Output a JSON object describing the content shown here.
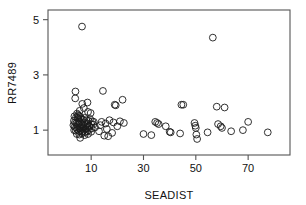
{
  "chart_data": {
    "type": "scatter",
    "title": "",
    "xlabel": "SEADIST",
    "ylabel": "RR7489",
    "xlim": [
      -6.5,
      86
    ],
    "ylim": [
      0.1,
      5.35
    ],
    "grid": false,
    "legend": null,
    "xticks": [
      10,
      30,
      50,
      70
    ],
    "xticklabels": [
      "10",
      "30",
      "50",
      "70"
    ],
    "yticks": [
      1,
      3,
      5
    ],
    "yticklabels": [
      "1",
      "3",
      "5"
    ],
    "marker": "open-circle",
    "marker_color": "#1b1b1b",
    "n_points": 108,
    "points": [
      {
        "x": 6.5,
        "y": 4.75
      },
      {
        "x": 56.5,
        "y": 4.35
      },
      {
        "x": 4.0,
        "y": 2.4
      },
      {
        "x": 14.5,
        "y": 2.42
      },
      {
        "x": 3.9,
        "y": 2.15
      },
      {
        "x": 8.6,
        "y": 2.0
      },
      {
        "x": 22.0,
        "y": 2.1
      },
      {
        "x": 19.0,
        "y": 1.92
      },
      {
        "x": 19.4,
        "y": 1.9
      },
      {
        "x": 6.6,
        "y": 1.95
      },
      {
        "x": 7.2,
        "y": 1.8
      },
      {
        "x": 44.5,
        "y": 1.92
      },
      {
        "x": 45.2,
        "y": 1.92
      },
      {
        "x": 58.0,
        "y": 1.85
      },
      {
        "x": 61.0,
        "y": 1.82
      },
      {
        "x": 5.6,
        "y": 1.7
      },
      {
        "x": 8.8,
        "y": 1.66
      },
      {
        "x": 9.8,
        "y": 1.62
      },
      {
        "x": 4.6,
        "y": 1.6
      },
      {
        "x": 5.0,
        "y": 1.55
      },
      {
        "x": 5.4,
        "y": 1.52
      },
      {
        "x": 3.6,
        "y": 1.5
      },
      {
        "x": 4.2,
        "y": 1.46
      },
      {
        "x": 4.8,
        "y": 1.44
      },
      {
        "x": 5.2,
        "y": 1.42
      },
      {
        "x": 5.9,
        "y": 1.48
      },
      {
        "x": 6.3,
        "y": 1.4
      },
      {
        "x": 6.9,
        "y": 1.38
      },
      {
        "x": 7.5,
        "y": 1.44
      },
      {
        "x": 8.2,
        "y": 1.36
      },
      {
        "x": 9.0,
        "y": 1.34
      },
      {
        "x": 9.6,
        "y": 1.4
      },
      {
        "x": 10.4,
        "y": 1.32
      },
      {
        "x": 11.0,
        "y": 1.3
      },
      {
        "x": 3.4,
        "y": 1.34
      },
      {
        "x": 3.8,
        "y": 1.28
      },
      {
        "x": 4.4,
        "y": 1.26
      },
      {
        "x": 5.0,
        "y": 1.24
      },
      {
        "x": 5.6,
        "y": 1.3
      },
      {
        "x": 6.2,
        "y": 1.22
      },
      {
        "x": 6.8,
        "y": 1.2
      },
      {
        "x": 7.4,
        "y": 1.26
      },
      {
        "x": 8.0,
        "y": 1.18
      },
      {
        "x": 8.6,
        "y": 1.24
      },
      {
        "x": 9.2,
        "y": 1.16
      },
      {
        "x": 10.0,
        "y": 1.22
      },
      {
        "x": 10.8,
        "y": 1.2
      },
      {
        "x": 3.2,
        "y": 1.18
      },
      {
        "x": 3.7,
        "y": 1.12
      },
      {
        "x": 4.3,
        "y": 1.1
      },
      {
        "x": 4.9,
        "y": 1.14
      },
      {
        "x": 5.5,
        "y": 1.08
      },
      {
        "x": 6.1,
        "y": 1.12
      },
      {
        "x": 6.7,
        "y": 1.06
      },
      {
        "x": 7.3,
        "y": 1.1
      },
      {
        "x": 7.9,
        "y": 1.04
      },
      {
        "x": 8.5,
        "y": 1.08
      },
      {
        "x": 9.4,
        "y": 1.12
      },
      {
        "x": 10.2,
        "y": 1.06
      },
      {
        "x": 11.5,
        "y": 1.1
      },
      {
        "x": 3.5,
        "y": 1.0
      },
      {
        "x": 4.1,
        "y": 0.98
      },
      {
        "x": 4.7,
        "y": 1.02
      },
      {
        "x": 5.3,
        "y": 0.96
      },
      {
        "x": 5.9,
        "y": 1.0
      },
      {
        "x": 6.5,
        "y": 0.94
      },
      {
        "x": 7.1,
        "y": 0.98
      },
      {
        "x": 7.7,
        "y": 0.92
      },
      {
        "x": 8.4,
        "y": 0.96
      },
      {
        "x": 9.1,
        "y": 1.0
      },
      {
        "x": 10.0,
        "y": 0.94
      },
      {
        "x": 4.5,
        "y": 0.86
      },
      {
        "x": 5.5,
        "y": 0.84
      },
      {
        "x": 6.5,
        "y": 0.88
      },
      {
        "x": 7.5,
        "y": 0.82
      },
      {
        "x": 8.8,
        "y": 0.86
      },
      {
        "x": 5.8,
        "y": 0.72
      },
      {
        "x": 14.0,
        "y": 1.3
      },
      {
        "x": 15.5,
        "y": 1.24
      },
      {
        "x": 13.5,
        "y": 1.18
      },
      {
        "x": 17.0,
        "y": 1.36
      },
      {
        "x": 18.5,
        "y": 1.28
      },
      {
        "x": 21.0,
        "y": 1.32
      },
      {
        "x": 22.5,
        "y": 1.26
      },
      {
        "x": 16.0,
        "y": 1.04
      },
      {
        "x": 13.0,
        "y": 0.96
      },
      {
        "x": 15.0,
        "y": 0.8
      },
      {
        "x": 16.5,
        "y": 0.78
      },
      {
        "x": 18.0,
        "y": 0.9
      },
      {
        "x": 20.0,
        "y": 1.14
      },
      {
        "x": 30.0,
        "y": 0.86
      },
      {
        "x": 33.0,
        "y": 0.82
      },
      {
        "x": 34.5,
        "y": 1.3
      },
      {
        "x": 35.2,
        "y": 1.26
      },
      {
        "x": 35.8,
        "y": 1.22
      },
      {
        "x": 38.5,
        "y": 1.14
      },
      {
        "x": 40.0,
        "y": 0.94
      },
      {
        "x": 40.4,
        "y": 0.92
      },
      {
        "x": 44.0,
        "y": 0.88
      },
      {
        "x": 49.5,
        "y": 1.26
      },
      {
        "x": 49.8,
        "y": 1.16
      },
      {
        "x": 50.0,
        "y": 1.08
      },
      {
        "x": 50.2,
        "y": 0.84
      },
      {
        "x": 50.5,
        "y": 0.68
      },
      {
        "x": 54.5,
        "y": 0.92
      },
      {
        "x": 58.5,
        "y": 1.22
      },
      {
        "x": 59.5,
        "y": 1.14
      },
      {
        "x": 60.0,
        "y": 1.08
      },
      {
        "x": 63.5,
        "y": 0.96
      },
      {
        "x": 68.0,
        "y": 1.0
      },
      {
        "x": 70.0,
        "y": 1.3
      },
      {
        "x": 77.5,
        "y": 0.92
      }
    ]
  }
}
